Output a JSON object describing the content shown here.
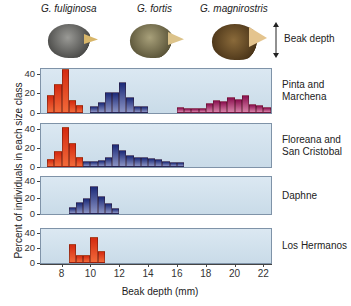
{
  "header": {
    "species": [
      "G. fuliginosa",
      "G. fortis",
      "G. magnirostris"
    ],
    "beak_label": "Beak depth"
  },
  "chart_data": {
    "type": "bar",
    "title": "",
    "xlabel": "Beak depth (mm)",
    "ylabel": "Percent of individuals in each size class",
    "xlim": [
      6.5,
      22.6
    ],
    "ylim": [
      0,
      45
    ],
    "x_ticks": [
      8,
      10,
      12,
      14,
      16,
      18,
      20,
      22
    ],
    "y_ticks": [
      0,
      20,
      40
    ],
    "bin_width_mm": 0.5,
    "legend": [
      "G. fuliginosa",
      "G. fortis",
      "G. magnirostris"
    ],
    "grid": false,
    "panels": [
      {
        "label": "Pinta and Marchena",
        "series": [
          {
            "name": "G. fuliginosa",
            "color": "#e03c1a",
            "x": [
              7.0,
              7.5,
              8.0,
              8.5,
              9.0
            ],
            "values": [
              18,
              30,
              45,
              13,
              8
            ]
          },
          {
            "name": "G. fortis",
            "color": "#25307e",
            "x": [
              10.0,
              10.5,
              11.0,
              11.5,
              12.0,
              12.5,
              13.0,
              13.5,
              14.0
            ],
            "values": [
              7,
              11,
              22,
              22,
              32,
              16,
              7,
              7,
              0
            ]
          },
          {
            "name": "G. magnirostris",
            "color": "#a01860",
            "x": [
              16.0,
              16.5,
              17.0,
              17.5,
              18.0,
              18.5,
              19.0,
              19.5,
              20.0,
              20.5,
              21.0,
              21.5,
              22.0
            ],
            "values": [
              6,
              5,
              5,
              5,
              10,
              13,
              12,
              16,
              14,
              18,
              9,
              8,
              6
            ]
          }
        ]
      },
      {
        "label": "Floreana and San Cristobal",
        "series": [
          {
            "name": "G. fuliginosa",
            "color": "#e03c1a",
            "x": [
              7.0,
              7.5,
              8.0,
              8.5,
              9.0
            ],
            "values": [
              8,
              17,
              42,
              25,
              10
            ]
          },
          {
            "name": "G. fortis",
            "color": "#25307e",
            "x": [
              9.5,
              10.0,
              10.5,
              11.0,
              11.5,
              12.0,
              12.5,
              13.0,
              13.5,
              14.0,
              14.5,
              15.0,
              15.5,
              16.0
            ],
            "values": [
              6,
              6,
              7,
              11,
              24,
              18,
              13,
              10,
              10,
              9,
              8,
              6,
              5,
              5
            ]
          }
        ]
      },
      {
        "label": "Daphne",
        "series": [
          {
            "name": "G. fortis",
            "color": "#25307e",
            "x": [
              8.5,
              9.0,
              9.5,
              10.0,
              10.5,
              11.0,
              11.5
            ],
            "values": [
              8,
              15,
              20,
              34,
              22,
              14,
              7
            ]
          }
        ]
      },
      {
        "label": "Los Hermanos",
        "series": [
          {
            "name": "G. fuliginosa",
            "color": "#e03c1a",
            "x": [
              8.5,
              9.0,
              9.5,
              10.0,
              10.5
            ],
            "values": [
              25,
              10,
              10,
              34,
              16
            ]
          }
        ]
      }
    ]
  },
  "labels": {
    "panel_labels": [
      [
        "Pinta and",
        "Marchena"
      ],
      [
        "Floreana and",
        "San Cristobal"
      ],
      [
        "Daphne"
      ],
      [
        "Los Hermanos"
      ]
    ],
    "y_tick_labels": [
      "40",
      "20",
      "0"
    ],
    "x_tick_labels": [
      "8",
      "10",
      "12",
      "14",
      "16",
      "18",
      "20",
      "22"
    ]
  }
}
